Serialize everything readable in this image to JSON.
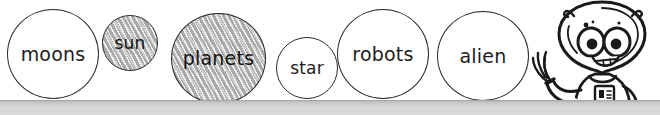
{
  "scene": {
    "title": "Space vocabulary word bubbles with alien mascot",
    "background_color": "#ffffff",
    "ink_color": "#2b2b2b",
    "shade_color": "#a9a9a9",
    "shelf": {
      "label": "shelf-bar",
      "top_color": "#b9b9b9",
      "bottom_color": "#dadada"
    }
  },
  "bubbles": [
    {
      "id": "moons",
      "word": "moons",
      "shaded": false
    },
    {
      "id": "sun",
      "word": "sun",
      "shaded": true
    },
    {
      "id": "planets",
      "word": "planets",
      "shaded": true
    },
    {
      "id": "star",
      "word": "star",
      "shaded": false
    },
    {
      "id": "robots",
      "word": "robots",
      "shaded": false
    },
    {
      "id": "alien",
      "word": "alien",
      "shaded": false
    }
  ],
  "mascot": {
    "name": "alien-mascot",
    "description": "smiling alien with two antennae, large eyes, waving hand and chest badge",
    "line_color": "#1a1a1a",
    "fill_color": "#ffffff"
  }
}
